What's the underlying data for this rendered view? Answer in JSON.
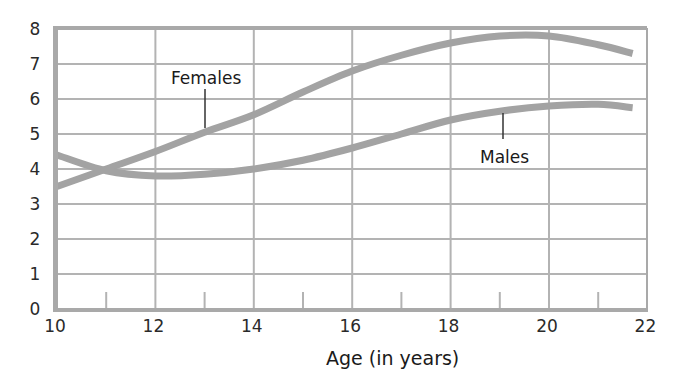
{
  "chart_data": {
    "type": "line",
    "title": "",
    "xlabel": "Age (in years)",
    "ylabel": "",
    "xlim": [
      10,
      22
    ],
    "ylim": [
      0,
      8
    ],
    "x_ticks": [
      10,
      12,
      14,
      16,
      18,
      20,
      22
    ],
    "x_minor_ticks": [
      11,
      13,
      15,
      17,
      19,
      21
    ],
    "y_ticks": [
      0,
      1,
      2,
      3,
      4,
      5,
      6,
      7,
      8
    ],
    "grid": true,
    "legend": "inline labels",
    "series": [
      {
        "name": "Females",
        "x": [
          10,
          11,
          12,
          13,
          14,
          15,
          16,
          17,
          18,
          19,
          20,
          21,
          21.7
        ],
        "values": [
          3.5,
          4.0,
          4.5,
          5.05,
          5.55,
          6.2,
          6.8,
          7.25,
          7.6,
          7.8,
          7.8,
          7.55,
          7.3
        ],
        "label_pos": {
          "x": 13,
          "y": 6.3
        }
      },
      {
        "name": "Males",
        "x": [
          10,
          11,
          12,
          13,
          14,
          15,
          16,
          17,
          18,
          19,
          20,
          21,
          21.7
        ],
        "values": [
          4.4,
          3.95,
          3.8,
          3.85,
          4.0,
          4.25,
          4.6,
          5.0,
          5.4,
          5.65,
          5.8,
          5.85,
          5.75
        ],
        "label_pos": {
          "x": 19,
          "y": 4.4
        }
      }
    ]
  },
  "colors": {
    "frame": "#a9a9a9",
    "grid": "#b3b3b3",
    "curve": "#a3a3a3",
    "text": "#222222"
  }
}
